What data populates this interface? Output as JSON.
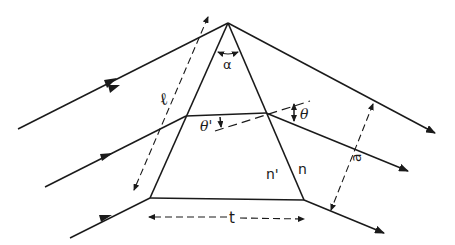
{
  "diagram": {
    "type": "prism-ray-diagram",
    "stroke_color": "#1a1a1a",
    "background": "#ffffff",
    "labels": {
      "apex_angle": "α",
      "slant_length": "ℓ",
      "inner_angle": "θ'",
      "outer_angle": "θ",
      "inner_index": "n'",
      "outer_index": "n",
      "beam_width": "a",
      "base_thickness": "t"
    },
    "rays": [
      {
        "name": "ray-top",
        "description": "incident ray through apex"
      },
      {
        "name": "ray-middle",
        "description": "ray refracted through prism"
      },
      {
        "name": "ray-bottom",
        "description": "ray through base corner"
      }
    ]
  }
}
